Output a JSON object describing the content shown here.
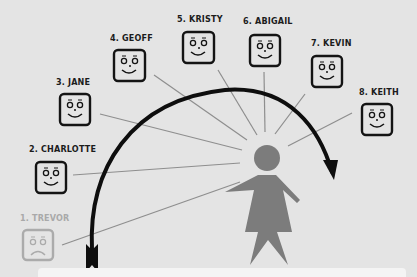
{
  "diagram": {
    "type": "ranking-sequence",
    "colors": {
      "background": "#e4e4e4",
      "ink": "#111111",
      "faded": "#aaaaaa",
      "figure": "#7c7c7c",
      "ray": "#8e8e8e"
    },
    "people": [
      {
        "rank": 1,
        "label": "1. TREVOR",
        "mood": "sad",
        "faded": true
      },
      {
        "rank": 2,
        "label": "2. CHARLOTTE",
        "mood": "happy",
        "faded": false
      },
      {
        "rank": 3,
        "label": "3. JANE",
        "mood": "happy",
        "faded": false
      },
      {
        "rank": 4,
        "label": "4. GEOFF",
        "mood": "happy",
        "faded": false
      },
      {
        "rank": 5,
        "label": "5. KRISTY",
        "mood": "happy",
        "faded": false
      },
      {
        "rank": 6,
        "label": "6. ABIGAIL",
        "mood": "happy",
        "faded": false
      },
      {
        "rank": 7,
        "label": "7. KEVIN",
        "mood": "happy",
        "faded": false
      },
      {
        "rank": 8,
        "label": "8. KEITH",
        "mood": "happy",
        "faded": false
      }
    ],
    "center_figure": "woman-silhouette-icon",
    "arrow": "curved-arrow-from-1-to-8"
  }
}
